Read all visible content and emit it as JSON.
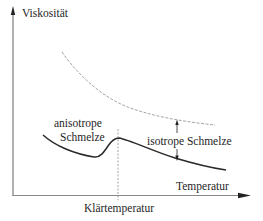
{
  "diagram": {
    "type": "viscosity-vs-temperature schematic",
    "y_axis": {
      "label": "Viskosität",
      "direction": "up"
    },
    "x_axis": {
      "label": "Temperatur",
      "direction": "right"
    },
    "labels": {
      "anisotropic_line1": "anisotrope",
      "anisotropic_line2": "Schmelze",
      "isotropic": "isotrope Schmelze",
      "clearing_temperature": "Klärtemperatur"
    },
    "curves": [
      {
        "name": "upper-reference-curve",
        "style": "dashed",
        "color": "#9a9a9a",
        "description": "monotonically decreasing viscosity"
      },
      {
        "name": "liquid-crystal-curve",
        "style": "solid",
        "color": "#2a2a2a",
        "description": "decreases in anisotropic melt, minimum before clearing point, peak at clearing temperature, then decreases in isotropic melt"
      }
    ],
    "markers": {
      "clearing_line": {
        "style": "dashed-vertical",
        "color": "#8a8a8a"
      },
      "double_arrow": {
        "meaning": "gap between curves in isotropic melt"
      }
    },
    "colors": {
      "axis": "#707070",
      "solid_curve": "#2a2a2a",
      "dashed_curve": "#9a9a9a",
      "arrow": "#222222"
    }
  }
}
